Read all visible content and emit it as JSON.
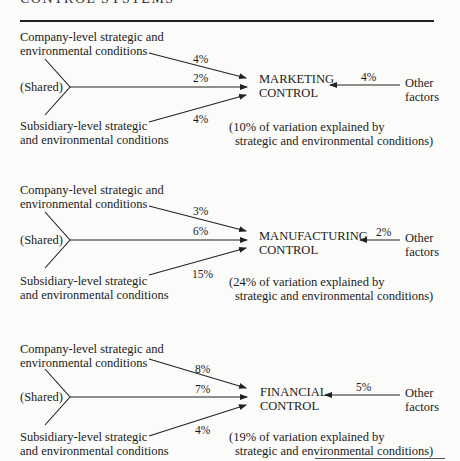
{
  "page_header": "CONTROL SYSTEMS",
  "labels": {
    "company": [
      "Company-level strategic and",
      "environmental conditions"
    ],
    "shared": "(Shared)",
    "subsidiary": [
      "Subsidiary-level strategic",
      "and environmental conditions"
    ],
    "other": [
      "Other",
      "factors"
    ],
    "explained_tail": "strategic and environmental conditions)"
  },
  "panels": [
    {
      "target": [
        "MARKETING",
        "CONTROL"
      ],
      "company_pct": "4%",
      "shared_pct": "2%",
      "subsidiary_pct": "4%",
      "other_pct": "4%",
      "explained": "(10% of variation explained by"
    },
    {
      "target": [
        "MANUFACTURING",
        "CONTROL"
      ],
      "company_pct": "3%",
      "shared_pct": "6%",
      "subsidiary_pct": "15%",
      "other_pct": "2%",
      "explained": "(24% of variation explained by"
    },
    {
      "target": [
        "FINANCIAL",
        "CONTROL"
      ],
      "company_pct": "8%",
      "shared_pct": "7%",
      "subsidiary_pct": "4%",
      "other_pct": "5%",
      "explained": "(19% of variation explained by"
    }
  ]
}
